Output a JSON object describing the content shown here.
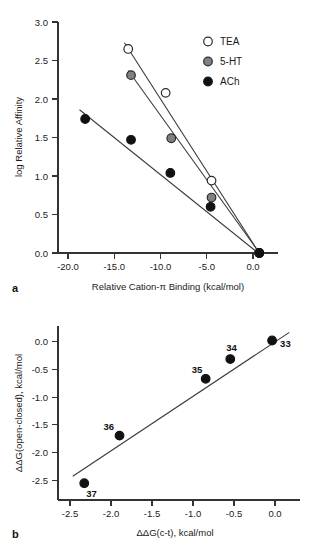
{
  "figure": {
    "panel_a_letter": "a",
    "panel_b_letter": "b"
  },
  "panel_a": {
    "xlabel": "Relative Cation-π Binding (kcal/mol)",
    "ylabel": "log Relative Affinity",
    "xticks": [
      "-20.0",
      "-15.0",
      "-10.0",
      "-5.0",
      "0.0"
    ],
    "yticks": [
      "0.0",
      "0.5",
      "1.0",
      "1.5",
      "2.0",
      "2.5",
      "3.0"
    ],
    "legend": [
      {
        "label": "TEA",
        "marker": "open-circle",
        "color": "#ffffff",
        "edge": "#2b2b2b"
      },
      {
        "label": "5-HT",
        "marker": "filled-circle",
        "color": "#808080",
        "edge": "#2b2b2b"
      },
      {
        "label": "ACh",
        "marker": "filled-circle",
        "color": "#111111",
        "edge": "#111111"
      }
    ]
  },
  "panel_b": {
    "xlabel": "ΔΔG(c-t), kcal/mol",
    "ylabel": "ΔΔG(open-closed), kcal/mol",
    "xticks": [
      "-2.5",
      "-2.0",
      "-1.5",
      "-1.0",
      "-0.5",
      "0.0"
    ],
    "yticks": [
      "-2.5",
      "-2.0",
      "-1.5",
      "-1.0",
      "-0.5",
      "0.0"
    ],
    "point_labels": [
      "33",
      "34",
      "35",
      "36",
      "37"
    ]
  },
  "chart_data": [
    {
      "type": "scatter",
      "panel": "a",
      "title": "",
      "xlabel": "Relative Cation-π Binding (kcal/mol)",
      "ylabel": "log Relative Affinity",
      "xlim": [
        -21.5,
        2.0
      ],
      "ylim": [
        0.0,
        3.0
      ],
      "xticks": [
        -20.0,
        -15.0,
        -10.0,
        -5.0,
        0.0
      ],
      "yticks": [
        0.0,
        0.5,
        1.0,
        1.5,
        2.0,
        2.5,
        3.0
      ],
      "grid": false,
      "legend_position": "top-right",
      "series": [
        {
          "name": "TEA",
          "marker": "open-circle",
          "color": "#ffffff",
          "edge_color": "#2b2b2b",
          "x": [
            -14.0,
            -10.0,
            -5.1,
            0.0
          ],
          "y": [
            2.65,
            2.08,
            0.94,
            0.0
          ],
          "fit_line": {
            "x": [
              -14.4,
              0.2
            ],
            "y": [
              2.73,
              -0.04
            ]
          }
        },
        {
          "name": "5-HT",
          "marker": "filled-circle",
          "color": "#808080",
          "edge_color": "#2b2b2b",
          "x": [
            -13.7,
            -9.4,
            -5.1,
            0.0
          ],
          "y": [
            2.31,
            1.49,
            0.72,
            0.0
          ],
          "fit_line": {
            "x": [
              -14.0,
              0.2
            ],
            "y": [
              2.37,
              -0.03
            ]
          }
        },
        {
          "name": "ACh",
          "marker": "filled-circle",
          "color": "#111111",
          "edge_color": "#111111",
          "x": [
            -18.6,
            -13.7,
            -9.5,
            -5.2,
            0.0
          ],
          "y": [
            1.74,
            1.47,
            1.04,
            0.6,
            0.0
          ],
          "fit_line": {
            "x": [
              -19.2,
              0.2
            ],
            "y": [
              1.86,
              -0.03
            ]
          }
        }
      ]
    },
    {
      "type": "scatter",
      "panel": "b",
      "title": "",
      "xlabel": "ΔΔG(c-t), kcal/mol",
      "ylabel": "ΔΔG(open-closed), kcal/mol",
      "xlim": [
        -2.6,
        0.35
      ],
      "ylim": [
        -2.75,
        0.25
      ],
      "xticks": [
        -2.5,
        -2.0,
        -1.5,
        -1.0,
        -0.5,
        0.0
      ],
      "yticks": [
        -2.5,
        -2.0,
        -1.5,
        -1.0,
        -0.5,
        0.0
      ],
      "grid": false,
      "legend_position": "none",
      "series": [
        {
          "name": "mutants",
          "marker": "filled-circle",
          "color": "#111111",
          "edge_color": "#111111",
          "x": [
            0.01,
            -0.5,
            -0.8,
            -1.85,
            -2.28
          ],
          "y": [
            0.0,
            -0.32,
            -0.66,
            -1.64,
            -2.46
          ],
          "labels": [
            "33",
            "34",
            "35",
            "36",
            "37"
          ],
          "label_offsets": [
            {
              "dx": 8,
              "dy": 6
            },
            {
              "dx": -4,
              "dy": -8
            },
            {
              "dx": -14,
              "dy": -6
            },
            {
              "dx": -16,
              "dy": -6
            },
            {
              "dx": 2,
              "dy": 14
            }
          ],
          "fit_line": {
            "x": [
              -2.42,
              0.22
            ],
            "y": [
              -2.34,
              0.14
            ]
          }
        }
      ]
    }
  ]
}
